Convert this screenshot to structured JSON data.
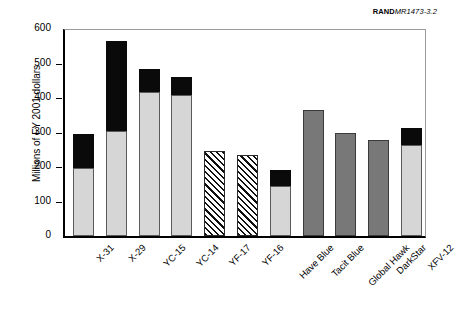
{
  "credit": {
    "prefix": "RAND",
    "number": "MR1473-3.2"
  },
  "chart_data": {
    "type": "bar",
    "title": "",
    "xlabel": "",
    "ylabel": "Millions of FY 2001 dollars",
    "ylim": [
      0,
      600
    ],
    "yticks": [
      0,
      100,
      200,
      300,
      400,
      500,
      600
    ],
    "ytick_labels": [
      "0",
      "100",
      "200",
      "300",
      "400",
      "500",
      "600"
    ],
    "grid": false,
    "legend": "none",
    "stacked": true,
    "categories": [
      "X-31",
      "X-29",
      "YC-15",
      "YC-14",
      "YF-17",
      "YF-16",
      "Have Blue",
      "Tacit Blue",
      "Global Hawk",
      "DarkStar",
      "XFV-12"
    ],
    "series": [
      {
        "name": "lower segment",
        "style": "light-gray",
        "values": [
          198,
          305,
          418,
          410,
          246,
          234,
          145,
          365,
          298,
          278,
          265
        ]
      },
      {
        "name": "upper segment",
        "style": "black",
        "values": [
          97,
          260,
          67,
          52,
          0,
          0,
          47,
          0,
          0,
          0,
          47
        ]
      }
    ],
    "totals": [
      295,
      565,
      485,
      462,
      246,
      234,
      192,
      365,
      298,
      278,
      312
    ],
    "bar_styles": [
      "light-gray-black",
      "light-gray-black",
      "light-gray-black",
      "light-gray-black",
      "hatched",
      "hatched",
      "light-gray-black",
      "dark-gray",
      "dark-gray",
      "dark-gray",
      "light-gray-black"
    ]
  },
  "colors": {
    "light_gray": "#d6d6d6",
    "black": "#0a0a0a",
    "dark_gray": "#787878",
    "axis": "#000000",
    "frame": "#9a9a9a",
    "background": "#ffffff"
  }
}
